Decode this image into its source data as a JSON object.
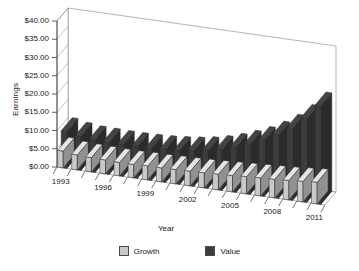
{
  "chart_data": {
    "type": "bar",
    "title": "",
    "xlabel": "Year",
    "ylabel": "Earnings",
    "ylim": [
      0,
      40
    ],
    "ytick_labels": [
      "$0.00",
      "$5.00",
      "$10.00",
      "$15.00",
      "$20.00",
      "$25.00",
      "$30.00",
      "$35.00",
      "$40.00"
    ],
    "ytick_values": [
      0,
      5,
      10,
      15,
      20,
      25,
      30,
      35,
      40
    ],
    "grid": false,
    "legend_position": "bottom",
    "projection": "3d",
    "categories": [
      "1993",
      "1994",
      "1995",
      "1996",
      "1997",
      "1998",
      "1999",
      "2000",
      "2001",
      "2002",
      "2003",
      "2004",
      "2005",
      "2006",
      "2007",
      "2008",
      "2009",
      "2010",
      "2011"
    ],
    "xtick_labels_shown": [
      "1993",
      "1996",
      "1999",
      "2002",
      "2005",
      "2008",
      "2011"
    ],
    "series": [
      {
        "name": "Growth",
        "color": "#c9c9c9",
        "values": [
          4.6,
          4.1,
          3.9,
          3.8,
          3.7,
          3.7,
          3.8,
          3.8,
          3.9,
          4.0,
          4.1,
          4.3,
          4.5,
          4.7,
          4.9,
          5.1,
          5.3,
          5.6,
          5.9
        ]
      },
      {
        "name": "Value",
        "color": "#3c3c3c",
        "values": [
          10.1,
          9.4,
          9.0,
          8.9,
          8.8,
          8.8,
          8.9,
          9.1,
          9.4,
          9.8,
          10.4,
          11.3,
          12.4,
          13.8,
          15.4,
          17.4,
          19.8,
          23.0,
          27.0
        ]
      }
    ]
  },
  "legend": {
    "items": [
      {
        "label": "Growth"
      },
      {
        "label": "Value"
      }
    ]
  }
}
